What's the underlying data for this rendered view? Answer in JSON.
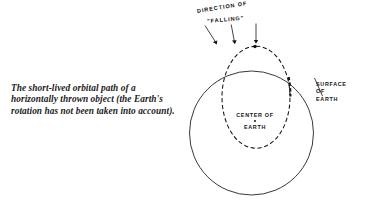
{
  "figure": {
    "caption": "The short-lived orbital path of a horizontally thrown object (the Earth's rotation has not been taken into account).",
    "labels": {
      "direction_line1": "DIRECTION OF",
      "direction_line2": "\"FALLING\"",
      "center_line1": "CENTER OF",
      "center_line2": "EARTH",
      "surface_line1": "SURFACE",
      "surface_line2": "OF",
      "surface_line3": "EARTH"
    },
    "colors": {
      "ink": "#141414",
      "caption_ink": "#1b1b1b",
      "paper": "#ffffff"
    },
    "geometry": {
      "earth_circle": {
        "cx": 251.5,
        "cy": 133,
        "r": 62
      },
      "orbit_ellipse": {
        "cx": 256,
        "cy": 97,
        "rx": 34,
        "ry": 51
      },
      "apex_marker": {
        "x": 255,
        "y": 46.5,
        "r": 1.7
      },
      "arrows": [
        {
          "x1": 206,
          "y1": 26,
          "x2": 216,
          "y2": 44
        },
        {
          "x1": 232,
          "y1": 25,
          "x2": 235,
          "y2": 43
        },
        {
          "x1": 256,
          "y1": 24,
          "x2": 256,
          "y2": 43
        }
      ],
      "leader_line": {
        "x1": 314,
        "y1": 78,
        "x2": 322,
        "y2": 95
      }
    }
  }
}
